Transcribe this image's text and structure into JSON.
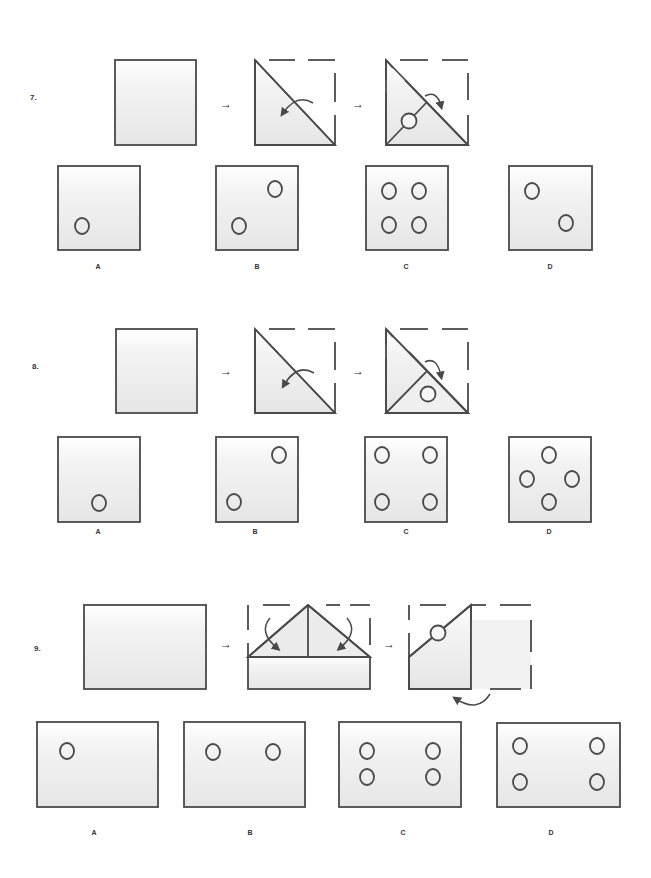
{
  "colors": {
    "stroke": "#4a4a4a",
    "fill_top": "#ffffff",
    "fill_bottom": "#e8e8e8"
  },
  "questions": [
    {
      "number": "7.",
      "sequence": [
        "square-blank",
        "fold-diagonal-top-right-to-bottom-left",
        "fold-again-punch-hole"
      ],
      "arrow_glyph": "→",
      "options": [
        {
          "label": "A",
          "holes": 1
        },
        {
          "label": "B",
          "holes": 2
        },
        {
          "label": "C",
          "holes": 4
        },
        {
          "label": "D",
          "holes": 2
        }
      ]
    },
    {
      "number": "8.",
      "sequence": [
        "square-blank",
        "fold-diagonal-top-right-to-bottom-left",
        "fold-again-punch-hole"
      ],
      "arrow_glyph": "→",
      "options": [
        {
          "label": "A",
          "holes": 1
        },
        {
          "label": "B",
          "holes": 2
        },
        {
          "label": "C",
          "holes": 4
        },
        {
          "label": "D",
          "holes": 4
        }
      ]
    },
    {
      "number": "9.",
      "sequence": [
        "rectangle-blank",
        "fold-top-corners-down",
        "fold-right-half-under-punch-hole"
      ],
      "arrow_glyph": "→",
      "options": [
        {
          "label": "A",
          "holes": 1
        },
        {
          "label": "B",
          "holes": 2
        },
        {
          "label": "C",
          "holes": 4
        },
        {
          "label": "D",
          "holes": 4
        }
      ]
    }
  ]
}
